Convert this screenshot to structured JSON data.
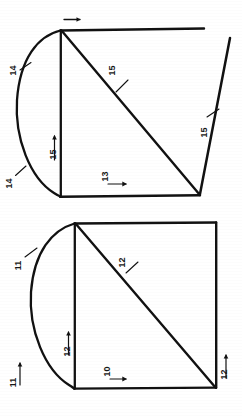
{
  "drawing": {
    "title": "Geometric line drawing with numbered reference labels",
    "background_color": "#ffffff",
    "line_color": "#111111",
    "figures": [
      {
        "name": "upper-figure",
        "labels": [
          {
            "id": "u-arrow-top",
            "text": "",
            "icon": "arrow-right-icon"
          },
          {
            "id": "u-14-upper",
            "text": "14"
          },
          {
            "id": "u-14-lower",
            "text": "14"
          },
          {
            "id": "u-15-vertical",
            "text": "15"
          },
          {
            "id": "u-15-diagonal",
            "text": "15"
          },
          {
            "id": "u-13-bottom",
            "text": "13"
          },
          {
            "id": "u-15-right",
            "text": "15"
          }
        ]
      },
      {
        "name": "lower-figure",
        "labels": [
          {
            "id": "l-11-upper",
            "text": "11"
          },
          {
            "id": "l-11-lower",
            "text": "11"
          },
          {
            "id": "l-12-vertical",
            "text": "12"
          },
          {
            "id": "l-12-diagonal",
            "text": "12"
          },
          {
            "id": "l-10-bottom",
            "text": "10"
          },
          {
            "id": "l-12-right",
            "text": "12"
          }
        ]
      }
    ]
  },
  "labels": {
    "upper": {
      "arc_top": "14",
      "arc_bottom": "14",
      "vertical": "15",
      "diagonal": "15",
      "bottom": "13",
      "right": "15"
    },
    "lower": {
      "arc_top": "11",
      "arc_bottom": "11",
      "vertical": "12",
      "diagonal": "12",
      "bottom": "10",
      "right": "12"
    }
  }
}
